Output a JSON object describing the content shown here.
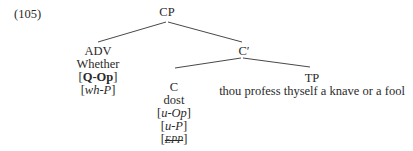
{
  "example_number": "(105)",
  "tree": {
    "root": "CP",
    "spec": {
      "category": "ADV",
      "word": "Whether",
      "features": [
        {
          "open": "[",
          "text": "Q-Op",
          "close": "]",
          "style": "bold"
        },
        {
          "open": "[",
          "text": "wh-P",
          "close": "]",
          "style": "italic"
        }
      ]
    },
    "bar": "C′",
    "head": {
      "category": "C",
      "word": "dost",
      "features": [
        {
          "open": "[",
          "text": "u-Op",
          "close": "]",
          "style": "italic"
        },
        {
          "open": "[",
          "text": "u-P",
          "close": "]",
          "style": "italic"
        },
        {
          "open": "[",
          "text": "EPP",
          "close": "]",
          "style": "strikethrough"
        }
      ]
    },
    "complement": {
      "category": "TP",
      "text": "thou profess thyself a knave or a fool"
    }
  }
}
